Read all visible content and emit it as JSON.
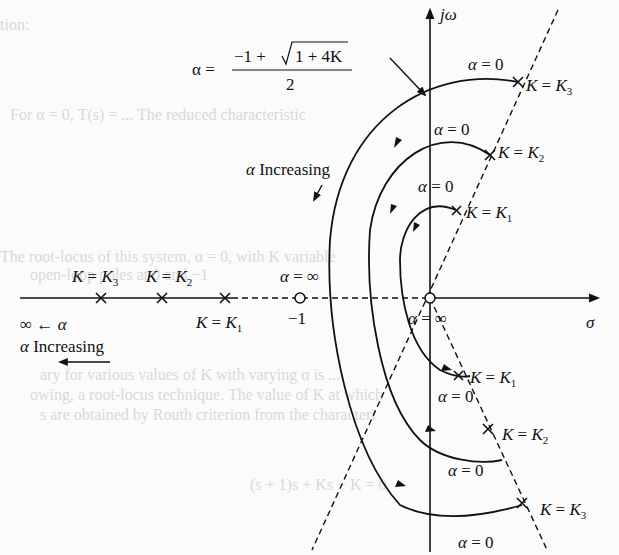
{
  "figure": {
    "type": "root-locus-diagram",
    "axes": {
      "imag_axis_label": "jω",
      "real_axis_label": "σ",
      "origin_label": "α = ∞",
      "minus_one_label": "−1"
    },
    "formula": {
      "lhs": "α =",
      "numerator_prefix": "−1 + ",
      "sqrt_content": "1 + 4K",
      "denominator": "2"
    },
    "upper_labels": {
      "alpha_increasing": "α Increasing",
      "k3": "K = K",
      "k3_sub": "3",
      "k2": "K = K",
      "k2_sub": "2",
      "k1": "K = K",
      "k1_sub": "1",
      "alpha_zero": "α = 0"
    },
    "lower_labels": {
      "k1": "K = K",
      "k1_sub": "1",
      "k2": "K = K",
      "k2_sub": "2",
      "k3": "K = K",
      "k3_sub": "3",
      "alpha_zero": "α = 0"
    },
    "real_axis_labels": {
      "k3": "K = K",
      "k3_sub": "3",
      "k2": "K = K",
      "k2_sub": "2",
      "k1": "K = K",
      "k1_sub": "1",
      "alpha_inf": "α = ∞",
      "inf_arrow": "∞ ← α",
      "alpha_increasing": "α Increasing"
    },
    "background_text": [
      "tion:",
      "For α = 0, T(s) = ... The reduced characteristic",
      "The root-locus of this system, α = 0, with K variable",
      "open-loop poles at 0 and −1",
      "ary for various values of K with varying α is ...",
      "owing, a root-locus technique. The value of K at which",
      "s are obtained by Routh criterion from the characteri",
      "(s + 1)s + Ks − K = 0"
    ]
  }
}
